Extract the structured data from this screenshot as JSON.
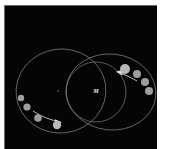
{
  "figure": {
    "background_color": "#050505",
    "page_background": "#ffffff",
    "center_label": "M",
    "frame": {
      "x": 4,
      "y": 5,
      "width": 153,
      "height": 144
    }
  },
  "orbits": [
    {
      "name": "left-orbit",
      "shape": "ellipse",
      "cx": 57,
      "cy": 86,
      "rx": 45,
      "ry": 42,
      "rotation": -8,
      "color": "#8f8f8f"
    },
    {
      "name": "right-orbit-outer",
      "shape": "ellipse",
      "cx": 107,
      "cy": 87,
      "rx": 45,
      "ry": 38,
      "rotation": 6,
      "color": "#8f8f8f"
    },
    {
      "name": "right-orbit-inner",
      "shape": "circle",
      "cx": 92,
      "cy": 87,
      "rx": 30,
      "ry": 30,
      "rotation": 0,
      "color": "#8a8a8a"
    }
  ],
  "center_marker": {
    "cx": 54,
    "cy": 86,
    "r": 0.9,
    "color": "#4a4a4a"
  },
  "label": {
    "text": "M",
    "x": 92,
    "y": 88,
    "color": "#f2f2f2"
  },
  "bodies": {
    "right_sequence": [
      {
        "cx": 121,
        "cy": 64,
        "r": 5.0,
        "brightness": "bright"
      },
      {
        "cx": 133,
        "cy": 69,
        "r": 4.0,
        "brightness": "normal"
      },
      {
        "cx": 141,
        "cy": 77,
        "r": 4.0,
        "brightness": "normal"
      },
      {
        "cx": 145,
        "cy": 86,
        "r": 4.0,
        "brightness": "normal"
      }
    ],
    "left_sequence": [
      {
        "cx": 17,
        "cy": 93,
        "r": 3.2,
        "brightness": "normal"
      },
      {
        "cx": 23,
        "cy": 102,
        "r": 3.6,
        "brightness": "normal"
      },
      {
        "cx": 34,
        "cy": 113,
        "r": 3.8,
        "brightness": "normal"
      },
      {
        "cx": 53,
        "cy": 120,
        "r": 4.2,
        "brightness": "bright"
      }
    ]
  },
  "arrows": [
    {
      "name": "right-direction-arrow",
      "direction": "left",
      "path": "M 133 76 C 126 72 120 69 113 67",
      "head": "113,67 119,65 118,70"
    },
    {
      "name": "left-direction-arrow",
      "direction": "right",
      "path": "M 29 106 C 38 112 47 115 56 117",
      "head": "58,117 51,114 52,119"
    }
  ],
  "colors": {
    "orbit_line": "#8f8f8f",
    "body_fill": "#9e9e9e",
    "body_fill_bright": "#b9b9b9",
    "arrow": "#e2e2e2",
    "label": "#f2f2f2",
    "panel_bg": "#050505"
  }
}
